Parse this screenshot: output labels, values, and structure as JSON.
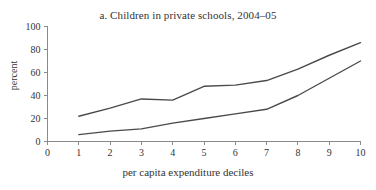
{
  "chart_data": {
    "type": "line",
    "title": "a. Children in private schools, 2004–05",
    "xlabel": "per capita expenditure deciles",
    "ylabel": "percent",
    "x": [
      1,
      2,
      3,
      4,
      5,
      6,
      7,
      8,
      9,
      10
    ],
    "xlim": [
      0,
      10
    ],
    "ylim": [
      0,
      100
    ],
    "xticks": [
      "0",
      "1",
      "2",
      "3",
      "4",
      "5",
      "6",
      "7",
      "8",
      "9",
      "10"
    ],
    "xtick_values": [
      0,
      1,
      2,
      3,
      4,
      5,
      6,
      7,
      8,
      9,
      10
    ],
    "yticks": [
      "0",
      "20",
      "40",
      "60",
      "80",
      "100"
    ],
    "ytick_values": [
      0,
      20,
      40,
      60,
      80,
      100
    ],
    "grid": false,
    "legend": "none",
    "series": [
      {
        "name": "upper-line",
        "color": "#4a4a4a",
        "values": [
          22,
          29,
          37,
          36,
          48,
          49,
          53,
          63,
          75,
          86
        ]
      },
      {
        "name": "lower-line",
        "color": "#4a4a4a",
        "values": [
          6,
          9,
          11,
          16,
          20,
          24,
          28,
          40,
          55,
          70
        ]
      }
    ]
  },
  "colors": {
    "line": "#4a4a4a",
    "axis": "#8a8a8a",
    "text": "#333333",
    "background": "#ffffff"
  }
}
